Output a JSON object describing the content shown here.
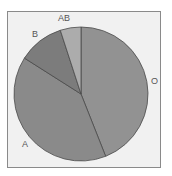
{
  "chart_data": {
    "type": "pie",
    "title": "",
    "categories": [
      "O",
      "A",
      "B",
      "AB"
    ],
    "values": [
      44,
      40,
      11,
      5
    ],
    "start_angle_deg": 0,
    "direction": "clockwise",
    "colors": [
      "#929292",
      "#8a8a8a",
      "#7c7c7c",
      "#acacac"
    ],
    "legend": "none",
    "labels_outside": true
  },
  "labels": {
    "O": "O",
    "A": "A",
    "B": "B",
    "AB": "AB"
  },
  "style": {
    "background": "#f1f1f1",
    "border": "#8a8a8a",
    "slice_stroke": "#4a4a4a"
  }
}
